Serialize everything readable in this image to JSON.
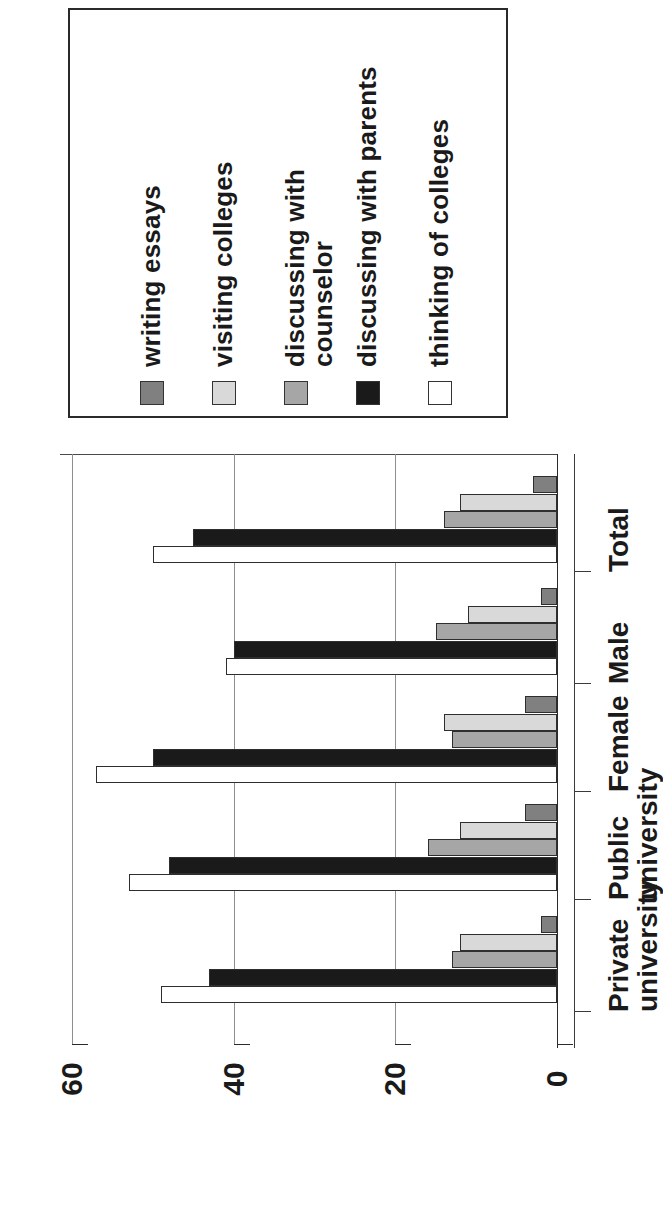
{
  "legend": {
    "items": [
      {
        "label": "writing essays",
        "color": "#808080"
      },
      {
        "label": "visiting colleges",
        "color": "#d9d9d9"
      },
      {
        "label": "discussing with\ncounselor",
        "color": "#a6a6a6"
      },
      {
        "label": "discussing with parents",
        "color": "#1a1a1a"
      },
      {
        "label": "thinking of colleges",
        "color": "#ffffff"
      }
    ]
  },
  "axis": {
    "value_ticks": [
      "0",
      "20",
      "40",
      "60"
    ],
    "category_labels": [
      "Total",
      "Male",
      "Female",
      "Public\nuniversity",
      "Private\nuniversity"
    ]
  },
  "chart_data": {
    "type": "bar",
    "orientation": "horizontal",
    "title": "",
    "xlabel": "",
    "ylabel": "",
    "categories": [
      "Total",
      "Male",
      "Female",
      "Public university",
      "Private university"
    ],
    "series": [
      {
        "name": "writing essays",
        "color": "#808080",
        "values": [
          3,
          2,
          4,
          4,
          2
        ]
      },
      {
        "name": "visiting colleges",
        "color": "#d9d9d9",
        "values": [
          12,
          11,
          14,
          12,
          12
        ]
      },
      {
        "name": "discussing with counselor",
        "color": "#a6a6a6",
        "values": [
          14,
          15,
          13,
          16,
          13
        ]
      },
      {
        "name": "discussing with parents",
        "color": "#1a1a1a",
        "values": [
          45,
          40,
          50,
          48,
          43
        ]
      },
      {
        "name": "thinking of colleges",
        "color": "#ffffff",
        "values": [
          50,
          41,
          57,
          53,
          49
        ]
      }
    ],
    "xlim": [
      0,
      60
    ],
    "xticks": [
      0,
      20,
      40,
      60
    ],
    "grid": true,
    "legend_position": "top"
  }
}
